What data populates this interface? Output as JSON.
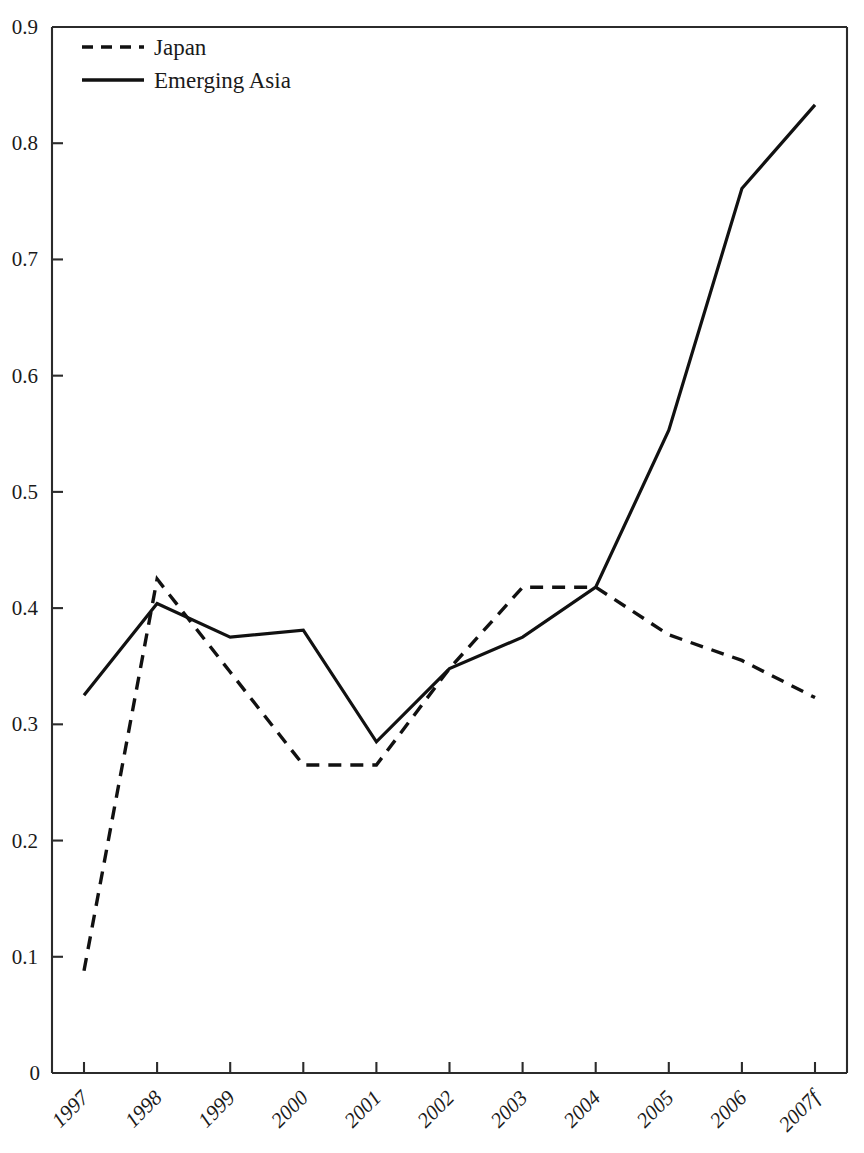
{
  "chart_data": {
    "type": "line",
    "title": "",
    "subtitle": "",
    "xlabel": "",
    "ylabel": "",
    "categories": [
      "1997",
      "1998",
      "1999",
      "2000",
      "2001",
      "2002",
      "2003",
      "2004",
      "2005",
      "2006",
      "2007f"
    ],
    "x_tick_labels": [
      "1997",
      "1998",
      "1999",
      "2000",
      "2001",
      "2002",
      "2003",
      "2004",
      "2005",
      "2006",
      "2007f"
    ],
    "y_tick_labels": [
      "0",
      "0.1",
      "0.2",
      "0.3",
      "0.4",
      "0.5",
      "0.6",
      "0.7",
      "0.8",
      "0.9"
    ],
    "y_tick_values": [
      0,
      0.1,
      0.2,
      0.3,
      0.4,
      0.5,
      0.6,
      0.7,
      0.8,
      0.9
    ],
    "ylim": [
      0,
      0.9
    ],
    "xlim": [
      "1997",
      "2007f"
    ],
    "grid": false,
    "legend_position": "top-left",
    "series": [
      {
        "name": "Japan",
        "style": "dashed",
        "color": "#111111",
        "values": [
          0.088,
          0.425,
          0.345,
          0.265,
          0.265,
          0.348,
          0.418,
          0.418,
          0.377,
          0.355,
          0.323
        ]
      },
      {
        "name": "Emerging Asia",
        "style": "solid",
        "color": "#111111",
        "values": [
          0.325,
          0.404,
          0.375,
          0.381,
          0.285,
          0.348,
          0.375,
          0.418,
          0.553,
          0.761,
          0.833
        ]
      }
    ],
    "legend": [
      {
        "label": "Japan",
        "style": "dashed"
      },
      {
        "label": "Emerging Asia",
        "style": "solid"
      }
    ],
    "annotations": []
  },
  "colors": {
    "background": "#ffffff",
    "axis": "#2b2b2b",
    "series": "#111111"
  }
}
